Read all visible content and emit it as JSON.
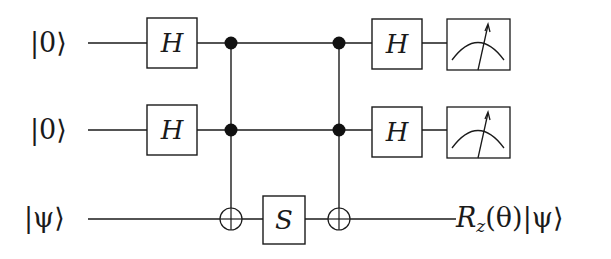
{
  "diagram": {
    "type": "quantum-circuit",
    "qubits": [
      {
        "input_label": "|0⟩",
        "output": "measure"
      },
      {
        "input_label": "|0⟩",
        "output": "measure"
      },
      {
        "input_label": "|ψ⟩",
        "output_label": "Rz(θ)|ψ⟩"
      }
    ],
    "gates": [
      {
        "name": "H",
        "qubit": 0,
        "column": 1
      },
      {
        "name": "H",
        "qubit": 1,
        "column": 1
      },
      {
        "name": "Toffoli",
        "controls": [
          0,
          1
        ],
        "target": 2,
        "column": 2
      },
      {
        "name": "S",
        "qubit": 2,
        "column": 3
      },
      {
        "name": "Toffoli",
        "controls": [
          0,
          1
        ],
        "target": 2,
        "column": 4
      },
      {
        "name": "H",
        "qubit": 0,
        "column": 5
      },
      {
        "name": "H",
        "qubit": 1,
        "column": 5
      },
      {
        "name": "Measure",
        "qubit": 0,
        "column": 6
      },
      {
        "name": "Measure",
        "qubit": 1,
        "column": 6
      }
    ],
    "labels": {
      "q0_in": "|0⟩",
      "q1_in": "|0⟩",
      "q2_in": "|ψ⟩",
      "h_gate": "H",
      "s_gate": "S",
      "out_R": "R",
      "out_sub": "z",
      "out_theta": "(θ)",
      "out_ket": "|ψ⟩"
    },
    "colors": {
      "line": "#1a1a1a",
      "background": "#ffffff"
    }
  }
}
